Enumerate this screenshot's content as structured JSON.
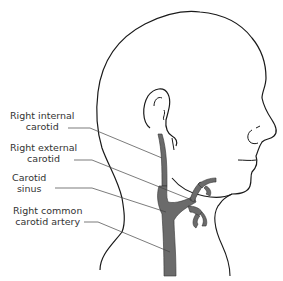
{
  "diagram": {
    "colors": {
      "outline": "#1a1a1a",
      "artery_fill": "#6b6b6b",
      "leader_line": "#444444",
      "text": "#333333"
    },
    "labels": [
      {
        "id": "internal",
        "line1": "Right internal",
        "line2": "carotid"
      },
      {
        "id": "external",
        "line1": "Right external",
        "line2": "carotid"
      },
      {
        "id": "sinus",
        "line1": "Carotid",
        "line2": "sinus"
      },
      {
        "id": "common",
        "line1": "Right common",
        "line2": "carotid artery"
      }
    ]
  }
}
